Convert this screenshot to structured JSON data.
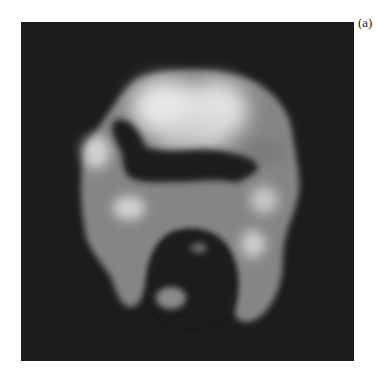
{
  "figure": {
    "panel_label": "(a)",
    "image_kind": "grayscale nuclear medicine scan",
    "colors": {
      "background": "#ffffff",
      "scan_background": "#1c1c1c",
      "tissue_mid": "#8a8a8a",
      "tissue_bright": "#e6e6e6"
    }
  }
}
